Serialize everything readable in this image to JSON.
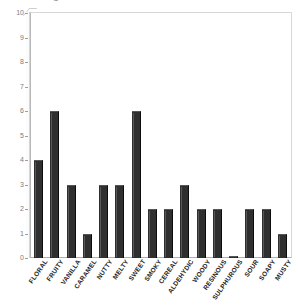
{
  "chart_data": {
    "type": "bar",
    "title": "",
    "title_clipped_text": "C",
    "xlabel": "",
    "ylabel": "",
    "ylim": [
      0,
      10
    ],
    "ytick_labels": [
      "0",
      "1",
      "2",
      "3",
      "4",
      "5",
      "6",
      "7",
      "8",
      "9",
      "10"
    ],
    "ytick_values": [
      0,
      1,
      2,
      3,
      4,
      5,
      6,
      7,
      8,
      9,
      10
    ],
    "grid": false,
    "legend": "none",
    "bar_color": "#2f2f2f",
    "categories": [
      "FLORAL",
      "FRUITY",
      "VANILLA",
      "CARAMEL",
      "NUTTY",
      "MELTY",
      "SWEET",
      "SMOKY",
      "CEREAL",
      "ALDEHYDIC",
      "WOODY",
      "RESINOUS",
      "SULPHUROUS",
      "SOUR",
      "SOAPY",
      "MUSTY"
    ],
    "values": [
      4,
      6,
      3,
      1,
      3,
      3,
      6,
      2,
      2,
      3,
      2,
      2,
      0.1,
      2,
      2,
      1
    ]
  }
}
